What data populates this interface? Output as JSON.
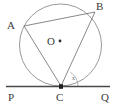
{
  "figure": {
    "type": "geometry-diagram",
    "background_color": "#ffffff",
    "stroke_color": "#6b6b6b",
    "tangent_color": "#4a4a4a",
    "label_color": "#3a3a3a"
  },
  "labels": {
    "A": "A",
    "B": "B",
    "O": "O",
    "P": "P",
    "C": "C",
    "Q": "Q",
    "angle_mark": "x"
  },
  "geometry": {
    "circle": {
      "cx": 60.5,
      "cy": 45,
      "r": 41
    },
    "center_dot": {
      "cx": 60,
      "cy": 41,
      "r": 1.4
    },
    "points": {
      "A": {
        "x": 24,
        "y": 26
      },
      "B": {
        "x": 95,
        "y": 12
      },
      "C": {
        "x": 61,
        "y": 86
      }
    },
    "tangent_line": {
      "x1": 6,
      "y1": 86.5,
      "x2": 110,
      "y2": 86.5
    },
    "chords": [
      {
        "name": "AB",
        "x1": 24,
        "y1": 26,
        "x2": 95,
        "y2": 12
      },
      {
        "name": "AC",
        "x1": 24,
        "y1": 26,
        "x2": 61,
        "y2": 86
      },
      {
        "name": "BC",
        "x1": 95,
        "y1": 12,
        "x2": 61,
        "y2": 86
      }
    ],
    "angle_arc": {
      "at": "C",
      "path": "M 78 86 A 17 17 0 0 0 70.2 72.1"
    }
  }
}
